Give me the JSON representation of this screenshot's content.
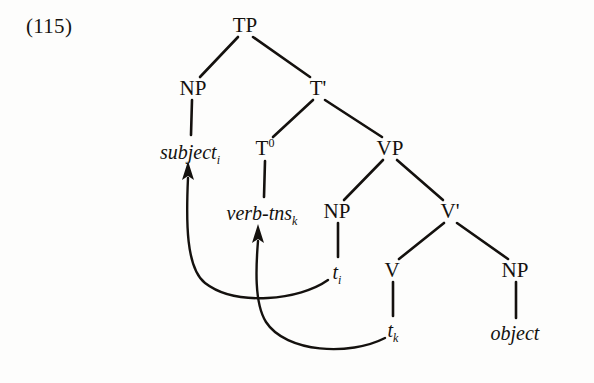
{
  "figure": {
    "example_number": "(115)",
    "kind": "x-bar-syntax-tree",
    "ink_color": "#14110e",
    "paper_color": "#fdfdfc"
  },
  "tree": {
    "nodes": [
      {
        "id": "TP",
        "label": "TP",
        "sup": "",
        "x": 245,
        "y": 25
      },
      {
        "id": "NP-subj",
        "label": "NP",
        "sup": "",
        "x": 193,
        "y": 88
      },
      {
        "id": "Tbar",
        "label": "T'",
        "sup": "",
        "x": 318,
        "y": 88
      },
      {
        "id": "T0",
        "label": "T",
        "sup": "0",
        "x": 265,
        "y": 148
      },
      {
        "id": "VP",
        "label": "VP",
        "sup": "",
        "x": 390,
        "y": 148
      },
      {
        "id": "NP-trace",
        "label": "NP",
        "sup": "",
        "x": 337,
        "y": 211
      },
      {
        "id": "Vbar",
        "label": "V'",
        "sup": "",
        "x": 450,
        "y": 211
      },
      {
        "id": "V",
        "label": "V",
        "sup": "",
        "x": 392,
        "y": 270
      },
      {
        "id": "NP-obj",
        "label": "NP",
        "sup": "",
        "x": 515,
        "y": 270
      }
    ],
    "terminals": [
      {
        "id": "subject",
        "text": "subject",
        "sub": "i",
        "x": 190,
        "y": 152
      },
      {
        "id": "verb-tns",
        "text": "verb-tns",
        "sub": "k",
        "x": 262,
        "y": 213
      },
      {
        "id": "object",
        "text": "object",
        "sub": "",
        "x": 515,
        "y": 333
      }
    ],
    "traces": [
      {
        "id": "trace-i",
        "text": "t",
        "sub": "i",
        "x": 337,
        "y": 272
      },
      {
        "id": "trace-k",
        "text": "t",
        "sub": "k",
        "x": 393,
        "y": 330
      }
    ],
    "branches": [
      {
        "from": "TP",
        "to": "NP-subj"
      },
      {
        "from": "TP",
        "to": "Tbar"
      },
      {
        "from": "Tbar",
        "to": "T0"
      },
      {
        "from": "Tbar",
        "to": "VP"
      },
      {
        "from": "VP",
        "to": "NP-trace"
      },
      {
        "from": "VP",
        "to": "Vbar"
      },
      {
        "from": "Vbar",
        "to": "V"
      },
      {
        "from": "Vbar",
        "to": "NP-obj"
      },
      {
        "from": "NP-subj",
        "to": "subject"
      },
      {
        "from": "T0",
        "to": "verb-tns"
      },
      {
        "from": "NP-trace",
        "to": "trace-i"
      },
      {
        "from": "V",
        "to": "trace-k"
      },
      {
        "from": "NP-obj",
        "to": "object"
      }
    ],
    "movement_arrows": [
      {
        "id": "arrow-subject-raising",
        "from": "trace-i",
        "to": "subject",
        "label": "NP movement: t_i to subject_i"
      },
      {
        "id": "arrow-verb-raising",
        "from": "trace-k",
        "to": "verb-tns",
        "label": "head movement: t_k to verb-tns_k"
      }
    ]
  }
}
